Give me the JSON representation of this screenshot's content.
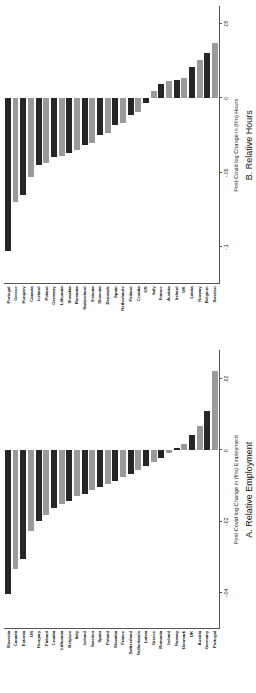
{
  "figure": {
    "background": "#ffffff",
    "bar_color_dark": "#262626",
    "bar_color_light": "#9a9a9a"
  },
  "chart_data": [
    {
      "type": "bar",
      "orientation": "horizontal",
      "panel_id": "A",
      "title": "A. Relative Employment",
      "xlabel": "Post-Covid log Change in (f/m) Employment",
      "ylabel": "",
      "xlim": [
        -0.05,
        0.028
      ],
      "xticks": [
        -0.04,
        -0.02,
        0,
        0.02
      ],
      "xticklabels": [
        "-.04",
        "-.02",
        "0",
        ".02"
      ],
      "grid": false,
      "legend": "none",
      "categories": [
        "Slovenia",
        "Canada",
        "Estonia",
        "US",
        "Hungary",
        "Finland",
        "Croatia",
        "Lithuania",
        "Belgium",
        "Italy",
        "Iceland",
        "Sweden",
        "Spain",
        "Poland",
        "Slovakia",
        "France",
        "Switzerland",
        "Netherlands",
        "Latvia",
        "Greece",
        "Romania",
        "Ireland",
        "Norway",
        "Denmark",
        "UK",
        "Austria",
        "Germany",
        "Portugal"
      ],
      "values": [
        -0.0405,
        -0.0335,
        -0.0305,
        -0.0228,
        -0.0198,
        -0.0182,
        -0.0162,
        -0.0152,
        -0.0142,
        -0.013,
        -0.0122,
        -0.0112,
        -0.0104,
        -0.0096,
        -0.0086,
        -0.0076,
        -0.0068,
        -0.0056,
        -0.0046,
        -0.0034,
        -0.0022,
        -0.0008,
        0.0005,
        0.0016,
        0.0042,
        0.0068,
        0.011,
        0.0222
      ]
    },
    {
      "type": "bar",
      "orientation": "horizontal",
      "panel_id": "B",
      "title": "B. Relative Hours",
      "xlabel": "Post-Covid log Change in (f/m) Hours",
      "ylabel": "",
      "xlim": [
        -0.125,
        0.062
      ],
      "xticks": [
        -0.1,
        -0.05,
        0,
        0.05
      ],
      "xticklabels": [
        "-.1",
        "-.05",
        "0",
        ".05"
      ],
      "grid": false,
      "legend": "none",
      "categories": [
        "Portugal",
        "Greece",
        "Hungary",
        "Canada",
        "Iceland",
        "Poland",
        "Germany",
        "Lithuania",
        "Slovakia",
        "Romania",
        "Switzerland",
        "Estonia",
        "Slovenia",
        "Denmark",
        "Spain",
        "Netherlands",
        "Finland",
        "Croatia",
        "US",
        "Italy",
        "France",
        "Austria",
        "Ireland",
        "UK",
        "Latvia",
        "Norway",
        "Belgium",
        "Sweden"
      ],
      "values": [
        -0.103,
        -0.07,
        -0.0655,
        -0.053,
        -0.0452,
        -0.044,
        -0.0398,
        -0.0392,
        -0.0372,
        -0.0352,
        -0.0318,
        -0.03,
        -0.0252,
        -0.0238,
        -0.0182,
        -0.0168,
        -0.0112,
        -0.0096,
        -0.0032,
        0.0048,
        0.0092,
        0.0112,
        0.0122,
        0.0138,
        0.0212,
        0.0258,
        0.03,
        0.0372
      ]
    }
  ]
}
